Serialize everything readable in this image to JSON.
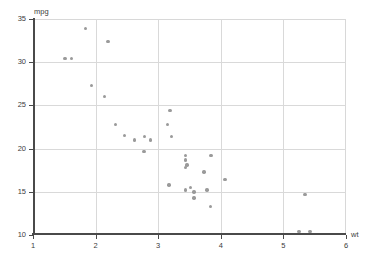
{
  "chart_data": {
    "type": "scatter",
    "title": "",
    "xlabel": "wt",
    "ylabel": "mpg",
    "xlim": [
      1,
      6
    ],
    "ylim": [
      10,
      35
    ],
    "xticks": [
      1,
      2,
      3,
      4,
      5,
      6
    ],
    "yticks": [
      10,
      15,
      20,
      25,
      30,
      35
    ],
    "grid": true,
    "legend": null,
    "marker_color": "#9a9a9a",
    "axis_color": "#4a4a4a",
    "grid_color": "#d9d9d9",
    "series": [
      {
        "name": "cars",
        "points": [
          [
            2.62,
            21.0
          ],
          [
            2.875,
            21.0
          ],
          [
            2.32,
            22.8
          ],
          [
            3.215,
            21.4
          ],
          [
            3.44,
            18.7
          ],
          [
            3.46,
            18.1
          ],
          [
            3.57,
            14.3
          ],
          [
            3.19,
            24.4
          ],
          [
            3.15,
            22.8
          ],
          [
            3.44,
            19.2
          ],
          [
            3.44,
            17.8
          ],
          [
            4.07,
            16.4
          ],
          [
            3.73,
            17.3
          ],
          [
            3.78,
            15.2
          ],
          [
            5.25,
            10.4
          ],
          [
            5.424,
            10.4
          ],
          [
            5.345,
            14.7
          ],
          [
            2.2,
            32.4
          ],
          [
            1.615,
            30.4
          ],
          [
            1.835,
            33.9
          ],
          [
            2.465,
            21.5
          ],
          [
            3.52,
            15.5
          ],
          [
            3.435,
            15.2
          ],
          [
            3.84,
            13.3
          ],
          [
            3.845,
            19.2
          ],
          [
            1.935,
            27.3
          ],
          [
            2.14,
            26.0
          ],
          [
            1.513,
            30.4
          ],
          [
            3.17,
            15.8
          ],
          [
            2.77,
            19.7
          ],
          [
            3.57,
            15.0
          ],
          [
            2.78,
            21.4
          ]
        ]
      }
    ]
  }
}
